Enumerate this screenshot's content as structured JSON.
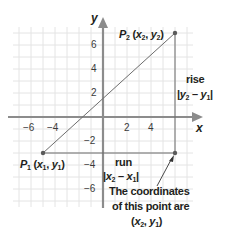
{
  "diagram": {
    "type": "coordinate-plane-distance",
    "axes": {
      "x_label": "x",
      "y_label": "y",
      "x_ticks": [
        {
          "label": "−6",
          "value": -6
        },
        {
          "label": "−4",
          "value": -4
        },
        {
          "label": "2",
          "value": 2
        },
        {
          "label": "4",
          "value": 4
        }
      ],
      "y_ticks": [
        {
          "label": "6",
          "value": 6
        },
        {
          "label": "4",
          "value": 4
        },
        {
          "label": "2",
          "value": 2
        },
        {
          "label": "−2",
          "value": -2
        },
        {
          "label": "−4",
          "value": -4
        },
        {
          "label": "−6",
          "value": -6
        }
      ],
      "range": {
        "x": [
          -7.5,
          7.5
        ],
        "y": [
          -7.5,
          7.5
        ]
      },
      "grid": true
    },
    "points": {
      "p1": {
        "name": "P",
        "sub": "1",
        "coords_text": "(x1, y1)",
        "x": -5,
        "y": -3
      },
      "p2": {
        "name": "P",
        "sub": "2",
        "coords_text": "(x2, y2)",
        "x": 6,
        "y": 7
      },
      "corner": {
        "x": 6,
        "y": -3
      }
    },
    "annotations": {
      "rise_title": "rise",
      "rise_formula": "|y2 − y1|",
      "run_title": "run",
      "run_formula": "|x2 − x1|",
      "corner_note_line1": "The coordinates",
      "corner_note_line2": "of this point are",
      "corner_note_line3": "(x2, y1)"
    },
    "colors": {
      "grid": "#e4e4e4",
      "axis": "#8c8c8c",
      "segment": "#6d6d6d",
      "point": "#5a5a5a",
      "text": "#231f20"
    }
  }
}
